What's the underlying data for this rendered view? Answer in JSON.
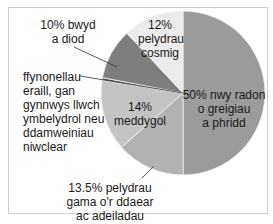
{
  "chart_data": {
    "type": "pie",
    "title": "",
    "start_angle": "12 o'clock, clockwise",
    "slices": [
      {
        "label": "50% nwy radon o greigiau a phridd",
        "value": 50,
        "color": "#9b9b9b"
      },
      {
        "label": "13.5% pelydrau gama o'r ddaear ac adeiladau",
        "value": 13.5,
        "color": "#b2b2b2"
      },
      {
        "label": "14% meddygol",
        "value": 14,
        "color": "#c4c4c4"
      },
      {
        "label": "ffynonellau eraill, gan gynnwys llwch ymbelydrol neu ddamweiniau niwclear",
        "value": 0.5,
        "color": "#5a5a5a"
      },
      {
        "label": "10% bwyd a diod",
        "value": 10,
        "color": "#7e7e7e"
      },
      {
        "label": "12% pelydrau cosmig",
        "value": 12,
        "color": "#ebebeb"
      }
    ]
  },
  "labels": {
    "radon": [
      "50% nwy radon",
      "o greigiau",
      "a phridd"
    ],
    "gamma": [
      "13.5% pelydrau",
      "gama o'r ddaear",
      "ac adeiladau"
    ],
    "medical": [
      "14%",
      "meddygol"
    ],
    "other": [
      "ffynonellau",
      "eraill, gan",
      "gynnwys llwch",
      "ymbelydrol neu",
      "ddamweiniau",
      "niwclear"
    ],
    "food": [
      "10% bwyd",
      "a diod"
    ],
    "cosmic": [
      "12%",
      "pelydrau",
      "cosmig"
    ]
  }
}
